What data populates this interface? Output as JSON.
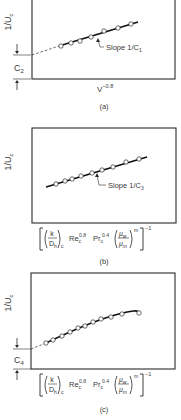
{
  "figure": {
    "panels": [
      {
        "id": "a",
        "caption": "(a)",
        "box": {
          "x": 32,
          "y": -2,
          "w": 143,
          "h": 81
        },
        "ylabel": "1/U",
        "ylabel_sub": "c",
        "xlabel": "V",
        "xlabel_sup": "−0.8",
        "slope_label": "Slope 1/C",
        "slope_sub": "1",
        "intercept_label": "C",
        "intercept_sub": "2",
        "intercept_y": 55,
        "dashed": [
          [
            32,
            55
          ],
          [
            59,
            46
          ]
        ],
        "solid": [
          [
            59,
            46
          ],
          [
            138,
            22
          ]
        ],
        "points": [
          [
            61,
            46
          ],
          [
            71,
            43
          ],
          [
            80,
            41
          ],
          [
            91,
            37
          ],
          [
            104,
            31
          ],
          [
            118,
            28
          ],
          [
            131,
            24
          ]
        ],
        "arrow_tip": [
          97,
          37
        ],
        "arrow_label_pos": [
          106,
          50
        ]
      },
      {
        "id": "b",
        "caption": "(b)",
        "box": {
          "x": 32,
          "y": 128,
          "w": 144,
          "h": 95
        },
        "ylabel": "1/U",
        "ylabel_sub": "c",
        "slope_label": "Slope 1/C",
        "slope_sub": "3",
        "solid": [
          [
            46,
            187
          ],
          [
            147,
            157
          ]
        ],
        "points": [
          [
            56,
            184
          ],
          [
            65,
            181
          ],
          [
            72,
            179
          ],
          [
            81,
            176
          ],
          [
            92,
            173
          ],
          [
            102,
            170
          ],
          [
            113,
            167
          ],
          [
            126,
            162
          ],
          [
            139,
            159
          ]
        ],
        "arrow_tip": [
          96,
          172
        ],
        "arrow_label_pos": [
          108,
          188
        ]
      },
      {
        "id": "c",
        "caption": "(c)",
        "box": {
          "x": 31,
          "y": 273,
          "w": 144,
          "h": 96
        },
        "ylabel": "1/U",
        "ylabel_sub": "c",
        "intercept_label": "C",
        "intercept_sub": "4",
        "intercept_y": 349,
        "dashed": [
          [
            31,
            349
          ],
          [
            46,
            343
          ]
        ],
        "curve": "M46 343 Q 90 322 115 315 T 139 313",
        "points": [
          [
            46,
            343
          ],
          [
            53,
            340
          ],
          [
            62,
            336
          ],
          [
            70,
            332
          ],
          [
            78,
            328
          ],
          [
            85,
            326
          ],
          [
            93,
            322
          ],
          [
            101,
            319
          ],
          [
            111,
            317
          ],
          [
            122,
            314
          ],
          [
            139,
            313
          ]
        ]
      }
    ],
    "xlabel_formula": {
      "k": "k",
      "Dh": "D",
      "Dh_sub": "h",
      "paren_sub": "c",
      "Re": "Re",
      "Re_sub": "c",
      "Re_sup": "0.8",
      "Pr": "Pr",
      "Pr_sub": "c",
      "Pr_sup": "0.4",
      "mu_w": "μ",
      "mu_w_sub": "w",
      "mu_m": "μ",
      "mu_m_sub": "m",
      "exp_m": "m",
      "exp_outer": "−1"
    }
  }
}
